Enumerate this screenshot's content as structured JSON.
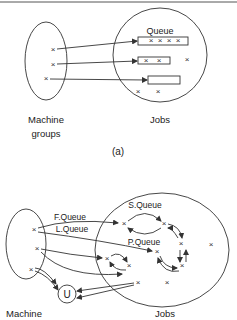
{
  "diagram_a": {
    "queue_label": "Queue",
    "left_label_line1": "Machine",
    "left_label_line2": "groups",
    "right_label": "Jobs",
    "caption": "(a)",
    "cross": "×"
  },
  "diagram_b": {
    "f_queue": "F.Queue",
    "l_queue": "L.Queue",
    "s_queue": "S.Queue",
    "p_queue": "P.Queue",
    "u_node": "U",
    "left_label": "Machine",
    "right_label": "Jobs",
    "cross": "×"
  }
}
